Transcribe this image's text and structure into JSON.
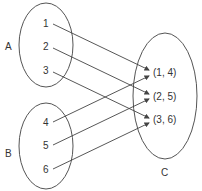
{
  "sets": {
    "A": {
      "label": "A",
      "elements": [
        "1",
        "2",
        "3"
      ]
    },
    "B": {
      "label": "B",
      "elements": [
        "4",
        "5",
        "6"
      ]
    },
    "C": {
      "label": "C",
      "elements": [
        "(1, 4)",
        "(2, 5)",
        "(3, 6)"
      ]
    }
  },
  "mappings": [
    {
      "from": "1",
      "to": "(1, 4)"
    },
    {
      "from": "2",
      "to": "(2, 5)"
    },
    {
      "from": "3",
      "to": "(3, 6)"
    },
    {
      "from": "4",
      "to": "(1, 4)"
    },
    {
      "from": "5",
      "to": "(2, 5)"
    },
    {
      "from": "6",
      "to": "(3, 6)"
    }
  ],
  "colors": {
    "stroke": "#444444",
    "text": "#333333",
    "background": "#ffffff"
  }
}
